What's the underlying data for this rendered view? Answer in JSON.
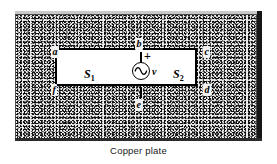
{
  "figure": {
    "caption": "Copper plate",
    "plate": {
      "material_label": "Copper plate",
      "texture": "stippled-engraving",
      "fill_color": "#efefef",
      "edge_shadow_color": "#161616",
      "bevel_color": "#c9c9c9"
    },
    "slot": {
      "border_color": "#000000",
      "fill_color": "#ffffff"
    },
    "surfaces": [
      {
        "id": "s1",
        "label": "S",
        "subscript": "1"
      },
      {
        "id": "s2",
        "label": "S",
        "subscript": "2"
      }
    ],
    "source": {
      "type": "ac-voltage-source",
      "symbol": "sine-in-circle",
      "polarity": "+",
      "voltage_label": "v"
    },
    "nodes": [
      {
        "id": "a",
        "label": "a",
        "position": "upper-left"
      },
      {
        "id": "b",
        "label": "b",
        "position": "top-center"
      },
      {
        "id": "c",
        "label": "c",
        "position": "upper-right"
      },
      {
        "id": "d",
        "label": "d",
        "position": "lower-right"
      },
      {
        "id": "e",
        "label": "e",
        "position": "bottom-center"
      },
      {
        "id": "f",
        "label": "f",
        "position": "lower-left"
      }
    ]
  }
}
